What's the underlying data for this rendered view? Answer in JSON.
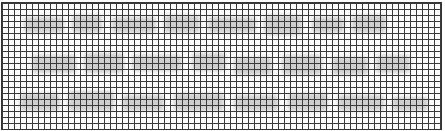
{
  "image": {
    "description": "Graph-paper grid overlaid on faint blurred gray shapes (obfuscated, illegible content)",
    "grid_cell_px": 6,
    "grid_color": "#3a3a3a",
    "background_color": "#ffffff",
    "blob_color": "#bdbdbd",
    "rows_of_shapes": 3
  },
  "blobs": [
    {
      "x": 22,
      "y": 14,
      "w": 40,
      "h": 16
    },
    {
      "x": 70,
      "y": 12,
      "w": 30,
      "h": 18
    },
    {
      "x": 110,
      "y": 14,
      "w": 44,
      "h": 16
    },
    {
      "x": 162,
      "y": 12,
      "w": 36,
      "h": 18
    },
    {
      "x": 206,
      "y": 14,
      "w": 48,
      "h": 16
    },
    {
      "x": 262,
      "y": 12,
      "w": 38,
      "h": 20
    },
    {
      "x": 310,
      "y": 14,
      "w": 32,
      "h": 16
    },
    {
      "x": 350,
      "y": 12,
      "w": 34,
      "h": 18
    },
    {
      "x": 30,
      "y": 52,
      "w": 44,
      "h": 18
    },
    {
      "x": 82,
      "y": 50,
      "w": 40,
      "h": 20
    },
    {
      "x": 130,
      "y": 52,
      "w": 50,
      "h": 16
    },
    {
      "x": 190,
      "y": 50,
      "w": 34,
      "h": 18
    },
    {
      "x": 232,
      "y": 54,
      "w": 38,
      "h": 18
    },
    {
      "x": 280,
      "y": 52,
      "w": 40,
      "h": 20
    },
    {
      "x": 330,
      "y": 54,
      "w": 36,
      "h": 18
    },
    {
      "x": 374,
      "y": 52,
      "w": 34,
      "h": 18
    },
    {
      "x": 18,
      "y": 90,
      "w": 40,
      "h": 18
    },
    {
      "x": 66,
      "y": 88,
      "w": 46,
      "h": 20
    },
    {
      "x": 120,
      "y": 92,
      "w": 42,
      "h": 16
    },
    {
      "x": 172,
      "y": 90,
      "w": 50,
      "h": 18
    },
    {
      "x": 232,
      "y": 92,
      "w": 44,
      "h": 16
    },
    {
      "x": 286,
      "y": 90,
      "w": 40,
      "h": 18
    },
    {
      "x": 336,
      "y": 92,
      "w": 46,
      "h": 16
    },
    {
      "x": 390,
      "y": 94,
      "w": 36,
      "h": 14
    }
  ]
}
